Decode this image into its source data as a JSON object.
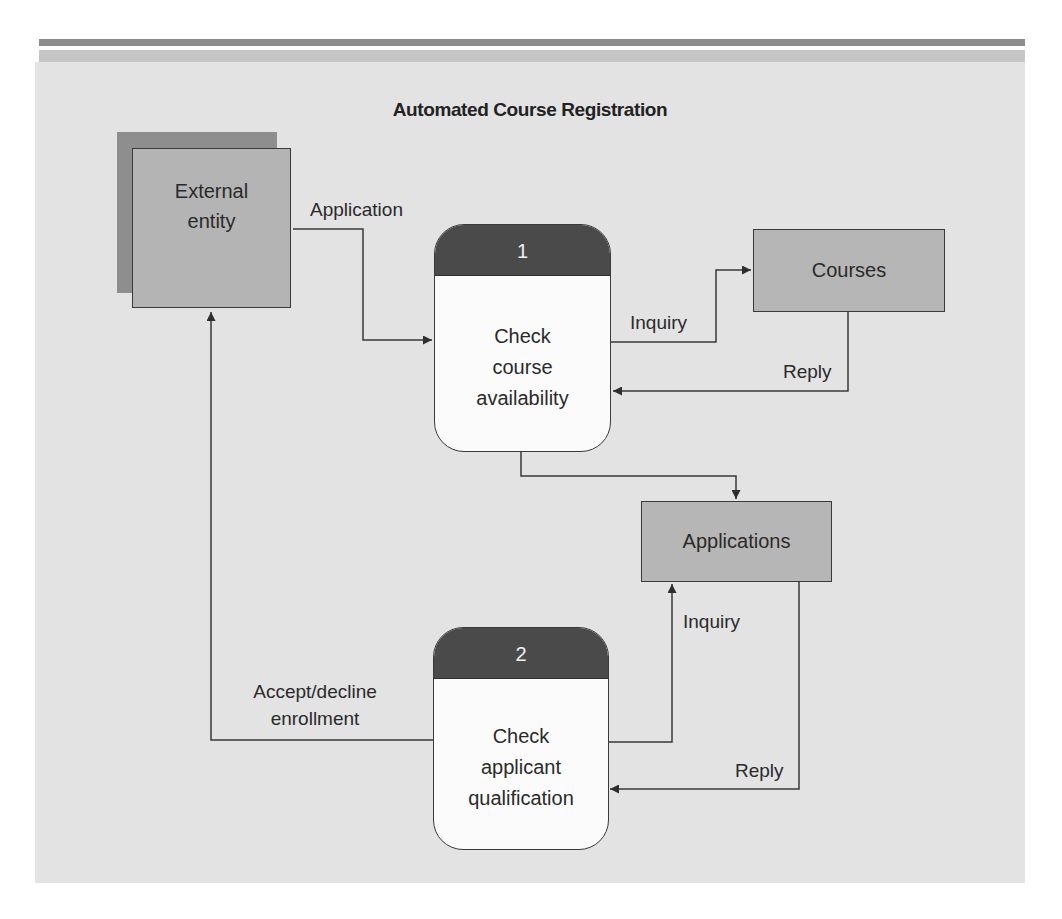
{
  "diagram": {
    "title": "Automated Course Registration",
    "external_entity": {
      "label_line1": "External",
      "label_line2": "entity"
    },
    "processes": [
      {
        "number": "1",
        "line1": "Check",
        "line2": "course",
        "line3": "availability"
      },
      {
        "number": "2",
        "line1": "Check",
        "line2": "applicant",
        "line3": "qualification"
      }
    ],
    "data_stores": [
      {
        "label": "Courses"
      },
      {
        "label": "Applications"
      }
    ],
    "flows": {
      "application": "Application",
      "inquiry_courses": "Inquiry",
      "reply_courses": "Reply",
      "inquiry_applications": "Inquiry",
      "reply_applications": "Reply",
      "accept_decline_line1": "Accept/decline",
      "accept_decline_line2": "enrollment"
    },
    "colors": {
      "panel": "#e3e3e3",
      "process_header": "#4a4a4a",
      "store_fill": "#b6b6b6",
      "entity_fill": "#b4b4b4",
      "entity_shadow": "#8e8e8e"
    }
  }
}
